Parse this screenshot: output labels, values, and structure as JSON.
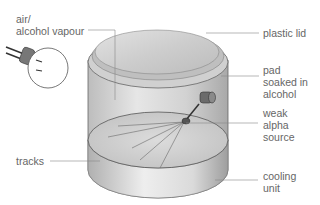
{
  "diagram": {
    "type": "cloud chamber",
    "labels": {
      "air_vapour": [
        "air/",
        "alcohol vapour"
      ],
      "plastic_lid": "plastic lid",
      "pad": [
        "pad",
        "soaked in",
        "alcohol"
      ],
      "alpha_source": [
        "weak",
        "alpha",
        "source"
      ],
      "tracks": "tracks",
      "cooling_unit": [
        "cooling",
        "unit"
      ]
    },
    "colors": {
      "text": "#666666",
      "leader_line": "#888888",
      "outline": "#555555",
      "body_fill": "#d6d6d6",
      "lid_fill": "#cfcfcf"
    }
  }
}
